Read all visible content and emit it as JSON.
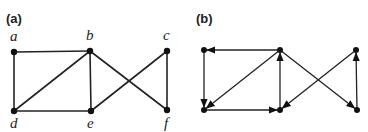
{
  "panels": [
    {
      "id": "a",
      "label": "(a)",
      "label_pos": [
        6,
        23
      ],
      "directed": false,
      "nodes": [
        {
          "id": "a",
          "label": "a",
          "x": 14,
          "y": 52,
          "lx": 10,
          "ly": 41
        },
        {
          "id": "b",
          "label": "b",
          "x": 90,
          "y": 51,
          "lx": 86,
          "ly": 40
        },
        {
          "id": "c",
          "label": "c",
          "x": 167,
          "y": 51,
          "lx": 163,
          "ly": 40
        },
        {
          "id": "d",
          "label": "d",
          "x": 14,
          "y": 111,
          "lx": 10,
          "ly": 128
        },
        {
          "id": "e",
          "label": "e",
          "x": 91,
          "y": 111,
          "lx": 87,
          "ly": 128
        },
        {
          "id": "f",
          "label": "f",
          "x": 167,
          "y": 110,
          "lx": 164,
          "ly": 128
        }
      ],
      "edges": [
        [
          "a",
          "b"
        ],
        [
          "a",
          "d"
        ],
        [
          "b",
          "d"
        ],
        [
          "b",
          "e"
        ],
        [
          "d",
          "e"
        ],
        [
          "b",
          "f"
        ],
        [
          "c",
          "e"
        ],
        [
          "c",
          "f"
        ]
      ]
    },
    {
      "id": "b",
      "label": "(b)",
      "label_pos": [
        196,
        23
      ],
      "directed": true,
      "nodes": [
        {
          "id": "a",
          "x": 204,
          "y": 50
        },
        {
          "id": "b",
          "x": 280,
          "y": 50
        },
        {
          "id": "c",
          "x": 356,
          "y": 50
        },
        {
          "id": "d",
          "x": 204,
          "y": 110
        },
        {
          "id": "e",
          "x": 280,
          "y": 110
        },
        {
          "id": "f",
          "x": 357,
          "y": 110
        }
      ],
      "edges": [
        [
          "b",
          "a"
        ],
        [
          "a",
          "d"
        ],
        [
          "b",
          "d"
        ],
        [
          "e",
          "b"
        ],
        [
          "d",
          "e"
        ],
        [
          "b",
          "f"
        ],
        [
          "c",
          "e"
        ],
        [
          "f",
          "c"
        ]
      ]
    }
  ]
}
